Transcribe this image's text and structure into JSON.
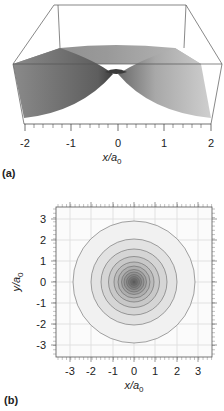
{
  "chart_data": [
    {
      "type": "surface",
      "panel": "(a)",
      "title": "",
      "description": "3D surface of a cusp-shaped function peaking at x=0 (exponential decay, e.g. hydrogen 1s wavefunction exp(-r/a0)), viewed in perspective",
      "xlabel": "x/a0",
      "xlabel_main": "x/a",
      "xlabel_sub": "0",
      "xlim": [
        -2,
        2
      ],
      "xticks": [
        "-2",
        "-1",
        "0",
        "1",
        "2"
      ],
      "x": [
        -2,
        -1.5,
        -1,
        -0.5,
        0,
        0.5,
        1,
        1.5,
        2
      ],
      "z": [
        0.135,
        0.223,
        0.368,
        0.607,
        1.0,
        0.607,
        0.368,
        0.223,
        0.135
      ]
    },
    {
      "type": "contour",
      "panel": "(b)",
      "title": "",
      "description": "Concentric circular contour plot centered at origin, darker shading toward center",
      "xlabel": "x/a0",
      "xlabel_main": "x/a",
      "xlabel_sub": "0",
      "ylabel": "y/a0",
      "ylabel_main": "y/a",
      "ylabel_sub": "0",
      "xlim": [
        -3.6,
        3.6
      ],
      "ylim": [
        -3.6,
        3.6
      ],
      "xticks": [
        "-3",
        "-2",
        "-1",
        "0",
        "1",
        "2",
        "3"
      ],
      "yticks": [
        "3",
        "2",
        "1",
        "0",
        "-1",
        "-2",
        "-3"
      ],
      "grid": true,
      "contour_radii": [
        2.9,
        2.05,
        1.55,
        1.2,
        0.95,
        0.75,
        0.6,
        0.47,
        0.36,
        0.26,
        0.17,
        0.08
      ],
      "contour_fill_colors": [
        "#f1f1f1",
        "#e2e2e2",
        "#d5d5d5",
        "#c8c8c8",
        "#bbbbbb",
        "#aeaeae",
        "#a0a0a0",
        "#929292",
        "#858585",
        "#777777",
        "#6a6a6a",
        "#5c5c5c"
      ]
    }
  ],
  "labels": {
    "panel_a": "(a)",
    "panel_b": "(b)"
  }
}
